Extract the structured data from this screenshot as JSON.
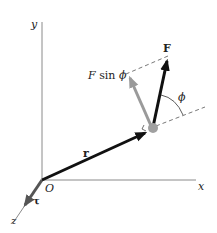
{
  "diagram": {
    "axes": {
      "x_label": "x",
      "y_label": "y",
      "z_label": "z",
      "origin_label": "O"
    },
    "vectors": {
      "position": {
        "label": "r",
        "color": "#111111"
      },
      "force": {
        "label": "F",
        "color": "#111111"
      },
      "perpendicular_component": {
        "label": "F sin ϕ",
        "color": "#9a9a9a"
      },
      "torque": {
        "label": "τ",
        "color": "#555555"
      }
    },
    "angle": {
      "label": "ϕ"
    },
    "particle": {
      "color": "#a0a0a0"
    },
    "colors": {
      "axis": "#8a8a8a",
      "dashed": "#555555",
      "background": "#ffffff"
    }
  }
}
